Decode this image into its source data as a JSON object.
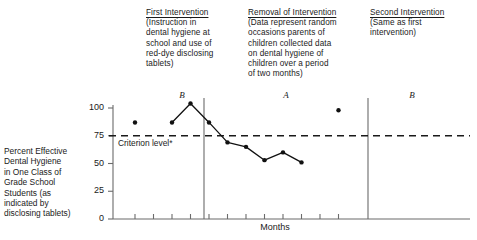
{
  "chart_data": {
    "type": "line",
    "title": "",
    "subtitle": "",
    "xlabel": "Months",
    "ylabel": "Percent Effective Dental Hygiene in One Class of Grade School Students (as indicated by disclosing tablets)",
    "ylim": [
      0,
      100
    ],
    "yticks": [
      0,
      25,
      50,
      75,
      100
    ],
    "grid": false,
    "legend": "none",
    "criterion_level": 75,
    "criterion_label": "Criterion level*",
    "design": "ABA reversal (B-A-B)",
    "phases": [
      {
        "letter": "B",
        "name": "First Intervention",
        "points": [
          {
            "x": 1,
            "y": 87
          }
        ]
      },
      {
        "letter": "A",
        "name": "Removal of Intervention",
        "points": [
          {
            "x": 3,
            "y": 87
          },
          {
            "x": 4,
            "y": 104
          },
          {
            "x": 5,
            "y": 87
          },
          {
            "x": 6,
            "y": 69
          },
          {
            "x": 7,
            "y": 65
          },
          {
            "x": 8,
            "y": 53
          },
          {
            "x": 9,
            "y": 60
          },
          {
            "x": 10,
            "y": 51
          }
        ]
      },
      {
        "letter": "B",
        "name": "Second Intervention",
        "points": [
          {
            "x": 12,
            "y": 98
          }
        ]
      }
    ],
    "annotations": [
      {
        "head": "First Intervention",
        "body": "(Instruction in\ndental hygiene at\nschool and use of\nred-dye disclosing\ntablets)"
      },
      {
        "head": "Removal of Intervention",
        "body": "(Data represent random\noccasions parents of\nchildren collected data\non dental hygiene of\nchildren over a period\nof two months)"
      },
      {
        "head": "Second Intervention",
        "body": "(Same as first\nintervention)"
      }
    ]
  },
  "axis": {
    "y_caption": "Percent Effective\nDental Hygiene\nin One Class of\nGrade School\nStudents (as\nindicated by\ndisclosing tablets)",
    "x_title": "Months",
    "ytick_100": "100",
    "ytick_75": "75",
    "ytick_50": "50",
    "ytick_25": "25",
    "ytick_0": "0",
    "criterion_label": "Criterion level*"
  },
  "notes": {
    "n1_head": "First Intervention",
    "n1_body": "(Instruction in\ndental hygiene at\nschool and use of\nred-dye disclosing\ntablets)",
    "n2_head": "Removal of Intervention",
    "n2_body": "(Data represent random\noccasions parents of\nchildren collected data\non dental hygiene of\nchildren over a period\nof two months)",
    "n3_head": "Second Intervention",
    "n3_body": "(Same as first\nintervention)"
  },
  "phase_letters": {
    "b1": "B",
    "a": "A",
    "b2": "B"
  },
  "colors": {
    "ink": "#1a1a1a",
    "axis": "#6b6b6b",
    "marker": "#111111",
    "line": "#111111"
  }
}
